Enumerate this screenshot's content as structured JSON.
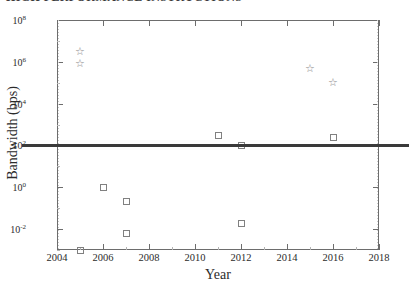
{
  "title": {
    "text": "HIGH PERFORMANCE INSTRUCTIONS",
    "note": "clipped at top edge of screenshot"
  },
  "chart_data": {
    "type": "scatter",
    "title": "",
    "xlabel": "Year",
    "ylabel": "Bandwidth (bps)",
    "xlim": [
      2004,
      2018
    ],
    "ylim_exponent": [
      -3,
      8
    ],
    "yscale": "log",
    "xticks": [
      2004,
      2006,
      2008,
      2010,
      2012,
      2014,
      2016,
      2018
    ],
    "xtick_labels": [
      "2004",
      "2006",
      "2008",
      "2010",
      "2012",
      "2014",
      "2016",
      "2018"
    ],
    "ytick_exponents": [
      8,
      6,
      4,
      2,
      0,
      -2
    ],
    "ytick_labels": [
      "10⁸",
      "10⁶",
      "10⁴",
      "10²",
      "10⁰",
      "10⁻²"
    ],
    "grid": false,
    "legend": null,
    "series": [
      {
        "name": "star-series",
        "marker": "star",
        "color": "#8a8a8a",
        "points": [
          {
            "x": 2005,
            "y": 3000000.0,
            "y_exponent": 6.48
          },
          {
            "x": 2005,
            "y": 800000.0,
            "y_exponent": 5.9
          },
          {
            "x": 2015,
            "y": 500000.0,
            "y_exponent": 5.7
          },
          {
            "x": 2016,
            "y": 100000.0,
            "y_exponent": 5.0
          }
        ]
      },
      {
        "name": "square-series",
        "marker": "square",
        "color": "#808080",
        "points": [
          {
            "x": 2005,
            "y": 0.001,
            "y_exponent": -3.0
          },
          {
            "x": 2006,
            "y": 1.0,
            "y_exponent": 0.0
          },
          {
            "x": 2007,
            "y": 0.2,
            "y_exponent": -0.7
          },
          {
            "x": 2007,
            "y": 0.006,
            "y_exponent": -2.22
          },
          {
            "x": 2011,
            "y": 300.0,
            "y_exponent": 2.48
          },
          {
            "x": 2012,
            "y": 100.0,
            "y_exponent": 2.0
          },
          {
            "x": 2012,
            "y": 0.018,
            "y_exponent": -1.74
          },
          {
            "x": 2016,
            "y": 250.0,
            "y_exponent": 2.4
          }
        ]
      }
    ],
    "reference_line": {
      "name": "threshold-line",
      "orientation": "horizontal",
      "y": 100,
      "y_exponent": 2,
      "color": "#3a3a3a",
      "linewidth": 2.4,
      "extends_beyond_axes": true
    }
  },
  "colors": {
    "axis": "#6d6d6d",
    "text": "#2b2b2b",
    "marker_square": "#808080",
    "marker_star": "#8a8a8a",
    "reference_line": "#3a3a3a",
    "minor_tick": "#b4b4b4",
    "background": "#ffffff"
  }
}
